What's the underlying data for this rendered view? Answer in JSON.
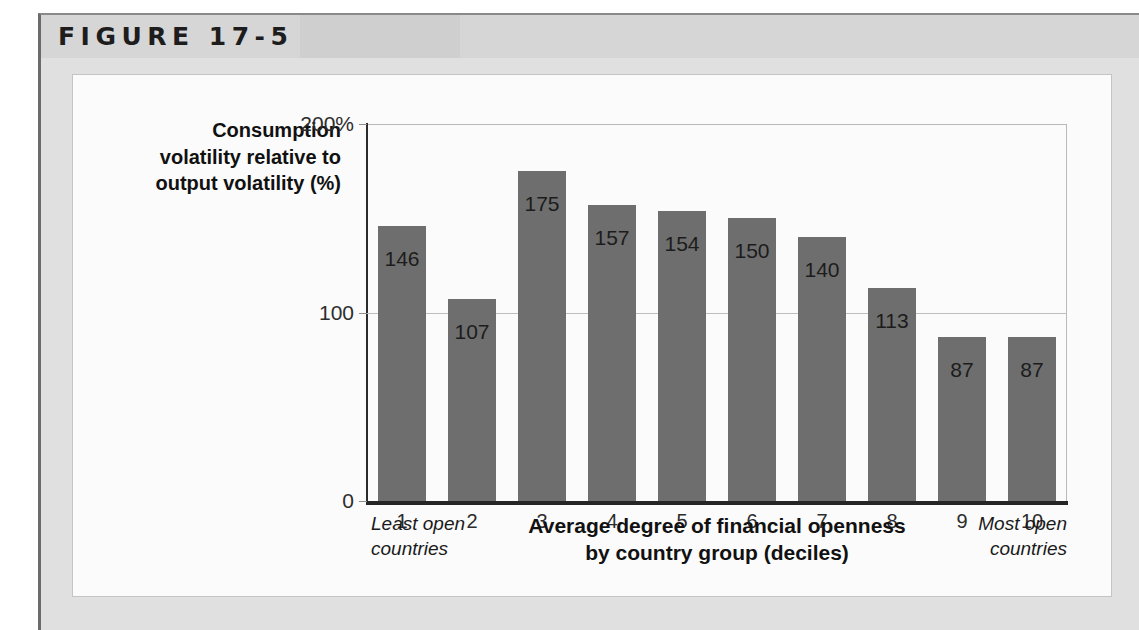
{
  "figure": {
    "title": "FIGURE 17-5"
  },
  "chart_data": {
    "type": "bar",
    "title": "",
    "categories": [
      "1",
      "2",
      "3",
      "4",
      "5",
      "6",
      "7",
      "8",
      "9",
      "10"
    ],
    "values": [
      146,
      107,
      175,
      157,
      154,
      150,
      140,
      113,
      87,
      87
    ],
    "value_labels": [
      "146",
      "107",
      "175",
      "157",
      "154",
      "150",
      "140",
      "113",
      "87",
      "87"
    ],
    "ylabel": "Consumption volatility relative to output volatility (%)",
    "ylabel_lines": [
      "Consumption",
      "volatility relative to",
      "output volatility (%)"
    ],
    "xlabel": "Average degree of financial openness by country group (deciles)",
    "xlabel_lines": [
      "Average degree of financial openness",
      "by country group (deciles)"
    ],
    "ylim": [
      0,
      200
    ],
    "yticks": [
      0,
      100,
      200
    ],
    "ytick_labels": [
      "0",
      "100",
      "200%"
    ],
    "grid": "horizontal-at-100",
    "legend": "none",
    "bar_color": "#6e6e6e",
    "annotations": {
      "left": "Least open countries",
      "left_lines": [
        "Least open",
        "countries"
      ],
      "right": "Most open countries",
      "right_lines": [
        "Most open",
        "countries"
      ]
    }
  },
  "colors": {
    "bar": "#6e6e6e",
    "axis": "#262626",
    "gridline": "#bdbdbd",
    "panel_background": "#e0e0e0",
    "chart_background": "#fbfbfb"
  }
}
